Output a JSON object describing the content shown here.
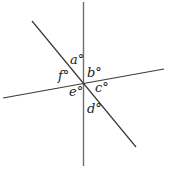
{
  "diagram": {
    "type": "intersecting-lines-angles",
    "line_color": "#3a3a3a",
    "vertical_line_color": "#6e6e6e",
    "lines": [
      {
        "name": "vertical-line",
        "x1": 83.5,
        "y1": 2,
        "x2": 83.5,
        "y2": 166
      },
      {
        "name": "diagonal-line",
        "x1": 32,
        "y1": 21,
        "x2": 136,
        "y2": 147
      },
      {
        "name": "horizontal-line",
        "x1": 3,
        "y1": 98,
        "x2": 164,
        "y2": 69
      }
    ],
    "labels": [
      {
        "name": "angle-a",
        "text": "a°",
        "x": 70,
        "y": 64
      },
      {
        "name": "angle-b",
        "text": "b°",
        "x": 87,
        "y": 77
      },
      {
        "name": "angle-c",
        "text": "c°",
        "x": 95,
        "y": 92
      },
      {
        "name": "angle-d",
        "text": "d°",
        "x": 87,
        "y": 113
      },
      {
        "name": "angle-e",
        "text": "e°",
        "x": 69,
        "y": 96
      },
      {
        "name": "angle-f",
        "text": "f°",
        "x": 58,
        "y": 80
      }
    ]
  }
}
